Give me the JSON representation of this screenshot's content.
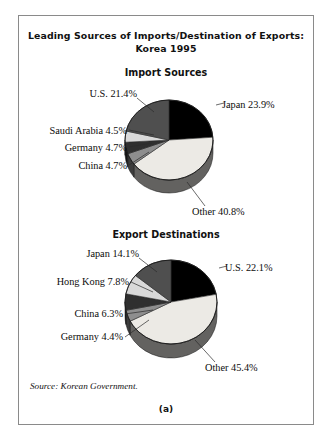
{
  "figure": {
    "title_line1": "Leading Sources of Imports/Destination of Exports:",
    "title_line2": "Korea 1995",
    "source_note": "Source: Korean Government.",
    "caption": "(a)"
  },
  "colors": {
    "black": "#000000",
    "dark_gray": "#4f4f4f",
    "mid_gray": "#8e8e8e",
    "light_gray": "#d9d9d9",
    "very_light": "#eceae5",
    "side_wall": "#6b6b6b",
    "border": "#8a8a8a",
    "text": "#0d0d0d"
  },
  "chart_data": [
    {
      "type": "pie",
      "title": "Import Sources",
      "categories": [
        "Japan",
        "Other",
        "China",
        "Germany",
        "Saudi Arabia",
        "U.S."
      ],
      "values": [
        23.9,
        40.8,
        4.7,
        4.7,
        4.5,
        21.4
      ],
      "labels": [
        "Japan 23.9%",
        "Other 40.8%",
        "China 4.7%",
        "Germany 4.7%",
        "Saudi Arabia 4.5%",
        "U.S. 21.4%"
      ],
      "slice_colors": [
        "#000000",
        "#eceae5",
        "#8e8e8e",
        "#2f2f2f",
        "#d9d9d9",
        "#4f4f4f"
      ],
      "legend": "none",
      "three_d": true
    },
    {
      "type": "pie",
      "title": "Export Destinations",
      "categories": [
        "U.S.",
        "Other",
        "Germany",
        "China",
        "Hong Kong",
        "Japan"
      ],
      "values": [
        22.1,
        45.4,
        4.4,
        6.3,
        7.8,
        14.1
      ],
      "labels": [
        "U.S. 22.1%",
        "Other 45.4%",
        "Germany 4.4%",
        "China 6.3%",
        "Hong Kong 7.8%",
        "Japan 14.1%"
      ],
      "slice_colors": [
        "#000000",
        "#eceae5",
        "#8e8e8e",
        "#2f2f2f",
        "#d9d9d9",
        "#4f4f4f"
      ],
      "legend": "none",
      "three_d": true
    }
  ]
}
